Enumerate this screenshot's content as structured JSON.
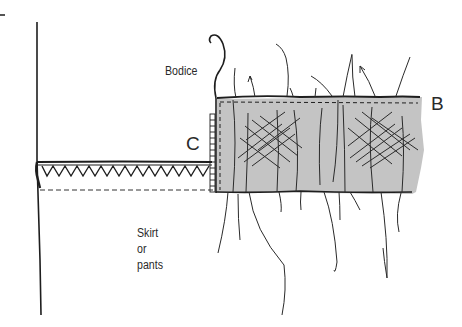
{
  "figure": {
    "type": "sewing-technique-illustration",
    "labels": {
      "bodice": "Bodice",
      "skirt": "Skirt\nor\npants",
      "point_b": "B",
      "point_c": "C"
    },
    "colors": {
      "ink": "#1e1e1e",
      "fabric_fill": "#c4c4c4",
      "background": "#ffffff"
    }
  }
}
